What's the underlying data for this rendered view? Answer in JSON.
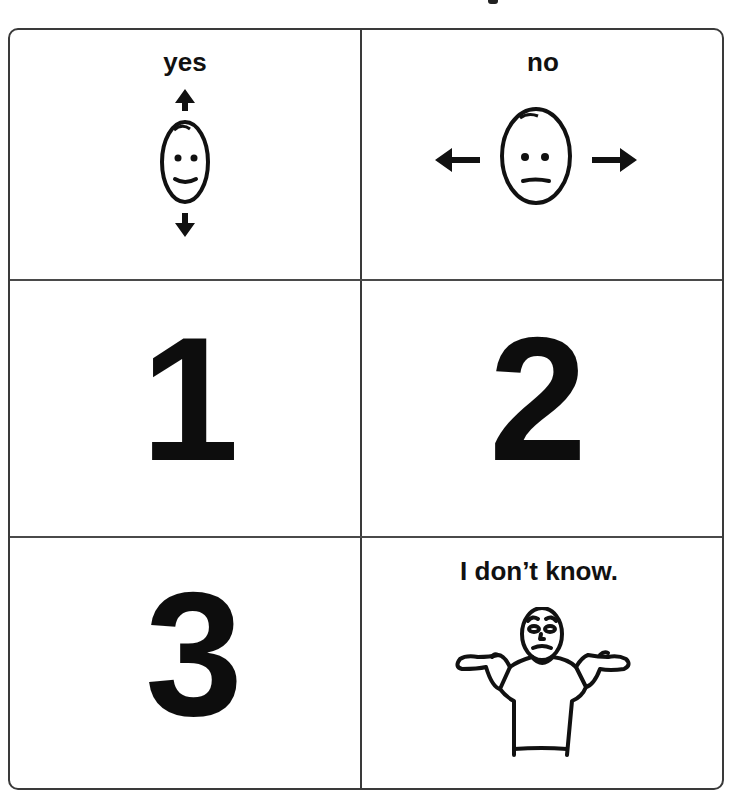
{
  "board": {
    "cells": [
      {
        "id": "yes",
        "label": "yes",
        "icon": "nod-yes-face-icon",
        "gesture": "head nod up/down"
      },
      {
        "id": "no",
        "label": "no",
        "icon": "shake-no-face-icon",
        "gesture": "head shake left/right"
      },
      {
        "id": "one",
        "label": "1"
      },
      {
        "id": "two",
        "label": "2"
      },
      {
        "id": "three",
        "label": "3"
      },
      {
        "id": "dont-know",
        "label": "I don’t know.",
        "icon": "shrug-person-icon"
      }
    ]
  },
  "colors": {
    "ink": "#111111",
    "border": "#3a3a3a",
    "background": "#ffffff"
  }
}
